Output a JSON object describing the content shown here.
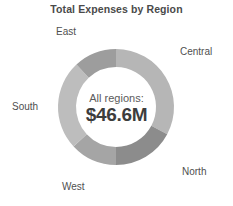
{
  "chart_data": {
    "type": "pie",
    "variant": "donut",
    "title": "Total Expenses by Region",
    "xlabel": "",
    "ylabel": "",
    "legend_position": "outside-labels",
    "grid": false,
    "units": "USD millions",
    "center_caption": "All regions:",
    "center_value": "$46.6M",
    "total": 46.6,
    "categories": [
      "Central",
      "North",
      "West",
      "South",
      "East"
    ],
    "values": [
      15.3,
      8.0,
      6.1,
      11.6,
      5.6
    ],
    "percentages": [
      32.8,
      17.2,
      13.1,
      24.9,
      12.0
    ],
    "start_angle_deg": 0,
    "direction": "clockwise",
    "series": [
      {
        "name": "Total Expenses by Region",
        "values": [
          15.3,
          8.0,
          6.1,
          11.6,
          5.6
        ]
      }
    ],
    "slices": [
      {
        "label": "Central",
        "value": 15.3,
        "percent": 32.8,
        "color": "#b6b6b6",
        "start_deg": 0,
        "end_deg": 118
      },
      {
        "label": "North",
        "value": 8.0,
        "percent": 17.2,
        "color": "#8c8c8c",
        "start_deg": 118,
        "end_deg": 180
      },
      {
        "label": "West",
        "value": 6.1,
        "percent": 13.1,
        "color": "#a5a5a5",
        "start_deg": 180,
        "end_deg": 227
      },
      {
        "label": "South",
        "value": 11.6,
        "percent": 24.9,
        "color": "#bdbdbd",
        "start_deg": 227,
        "end_deg": 317
      },
      {
        "label": "East",
        "value": 5.6,
        "percent": 12.0,
        "color": "#9d9d9d",
        "start_deg": 317,
        "end_deg": 360
      }
    ]
  },
  "labels": {
    "east": "East",
    "central": "Central",
    "south": "South",
    "north": "North",
    "west": "West"
  },
  "colors": {
    "background": "#ffffff",
    "title_text": "#4a4a4a",
    "label_text": "#4f4f4f",
    "value_text": "#3d3d3d",
    "central": "#b6b6b6",
    "north": "#8c8c8c",
    "west": "#a5a5a5",
    "south": "#bdbdbd",
    "east": "#9d9d9d"
  },
  "geometry": {
    "center_x": 116,
    "center_y": 107,
    "outer_radius": 58,
    "inner_radius": 40
  }
}
